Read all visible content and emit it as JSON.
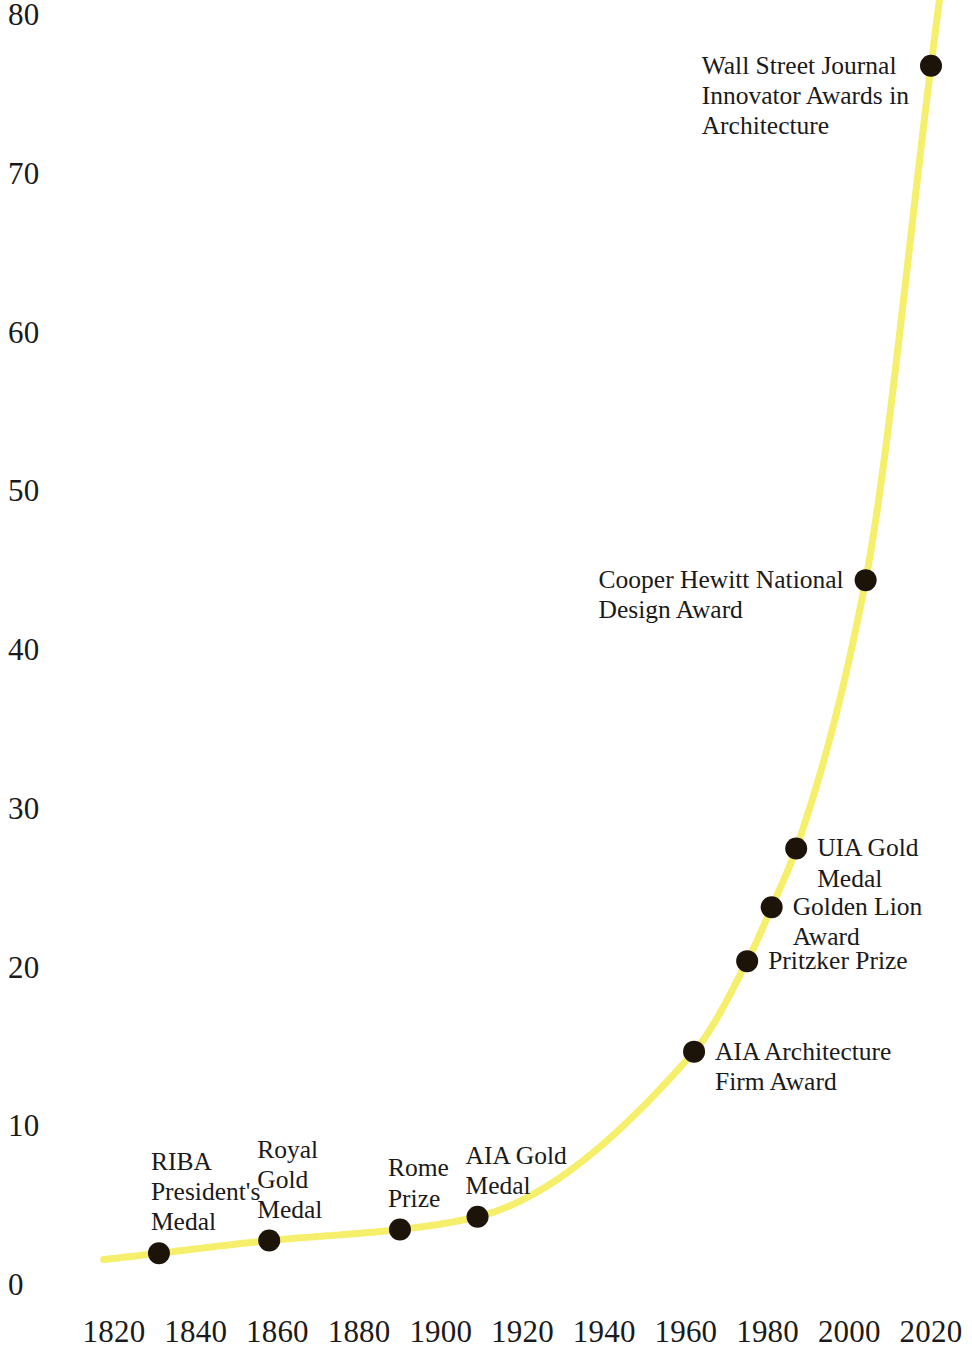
{
  "chart_data": {
    "type": "line",
    "title": "",
    "subtitle": "",
    "xlabel": "",
    "ylabel": "",
    "xlim": [
      1812,
      2032
    ],
    "ylim": [
      0,
      80
    ],
    "grid": false,
    "legend": null,
    "line_color": "#F5EF6B",
    "point_color": "#1C1408",
    "x_ticks": [
      "1820",
      "1840",
      "1860",
      "1880",
      "1900",
      "1920",
      "1940",
      "1960",
      "1980",
      "2000",
      "2020"
    ],
    "x_tick_values": [
      1820,
      1840,
      1860,
      1880,
      1900,
      1920,
      1940,
      1960,
      1980,
      2000,
      2020
    ],
    "y_ticks": [
      "0",
      "10",
      "20",
      "30",
      "40",
      "50",
      "60",
      "70",
      "80"
    ],
    "y_tick_values": [
      0,
      10,
      20,
      30,
      40,
      50,
      60,
      70,
      80
    ],
    "points": [
      {
        "label": "RIBA\nPresident's\nMedal",
        "x": 1831,
        "y": 2.0,
        "label_position": "above-left"
      },
      {
        "label": "Royal\nGold\nMedal",
        "x": 1858,
        "y": 2.8,
        "label_position": "above"
      },
      {
        "label": "Rome\nPrize",
        "x": 1890,
        "y": 3.5,
        "label_position": "above"
      },
      {
        "label": "AIA Gold\nMedal",
        "x": 1909,
        "y": 4.3,
        "label_position": "above"
      },
      {
        "label": "AIA Architecture\nFirm Award",
        "x": 1962,
        "y": 14.7,
        "label_position": "right"
      },
      {
        "label": "Pritzker Prize",
        "x": 1975,
        "y": 20.4,
        "label_position": "right"
      },
      {
        "label": "Golden Lion Award",
        "x": 1981,
        "y": 23.8,
        "label_position": "right"
      },
      {
        "label": "UIA Gold Medal",
        "x": 1987,
        "y": 27.5,
        "label_position": "right"
      },
      {
        "label": "Cooper Hewitt National\nDesign Award",
        "x": 2004,
        "y": 44.4,
        "label_position": "left"
      },
      {
        "label": "Wall Street Journal\nInnovator Awards in\nArchitecture",
        "x": 2020,
        "y": 76.8,
        "label_position": "left"
      }
    ],
    "curve_description": "Smooth exponential growth curve rising from near 2 at 1818 to beyond 80 past 2020"
  },
  "geometry": {
    "x_pixel_1820": 114,
    "x_pixel_2020": 931,
    "y_pixel_0": 1285,
    "y_pixel_80": 15
  }
}
